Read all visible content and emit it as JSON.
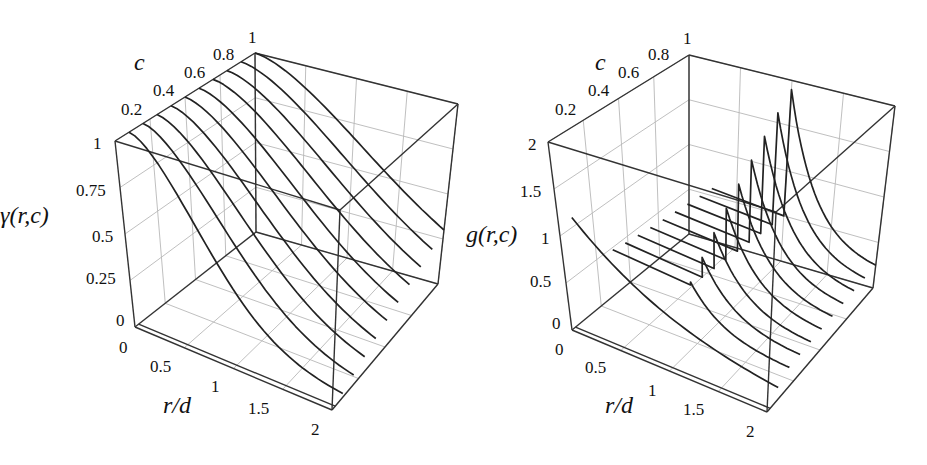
{
  "chart_data": [
    {
      "type": "line",
      "title": "",
      "zlabel": "γ(r,c)",
      "xlabel": "r/d",
      "ylabel": "c",
      "x_ticks": [
        "0",
        "0.5",
        "1",
        "1.5",
        "2"
      ],
      "y_ticks": [
        "0.2",
        "0.4",
        "0.6",
        "0.8",
        "1"
      ],
      "z_ticks": [
        "0",
        "0.25",
        "0.5",
        "0.75",
        "1"
      ],
      "xlim": [
        0,
        2
      ],
      "ylim": [
        0,
        1
      ],
      "zlim": [
        0,
        1
      ],
      "grid": true,
      "series_c": [
        0.1,
        0.2,
        0.3,
        0.4,
        0.5,
        0.6,
        0.7,
        0.8,
        0.9,
        1.0
      ],
      "description": "Curves of γ(r,c) vs r/d for c = 0.1..1.0; each starts at 1 at r=0 and decays smoothly, slower for larger c",
      "approx_end_values_r2": [
        0.02,
        0.05,
        0.08,
        0.11,
        0.14,
        0.17,
        0.2,
        0.23,
        0.26,
        0.3
      ]
    },
    {
      "type": "line",
      "title": "",
      "zlabel": "g(r,c)",
      "xlabel": "r/d",
      "ylabel": "c",
      "x_ticks": [
        "0",
        "0.5",
        "1",
        "1.5",
        "2"
      ],
      "y_ticks": [
        "0.2",
        "0.4",
        "0.6",
        "0.8",
        "1"
      ],
      "z_ticks": [
        "0",
        "0.5",
        "1",
        "1.5",
        "2"
      ],
      "xlim": [
        0,
        2
      ],
      "ylim": [
        0,
        1
      ],
      "zlim": [
        0,
        2
      ],
      "grid": true,
      "series_c": [
        0.1,
        0.2,
        0.3,
        0.4,
        0.5,
        0.6,
        0.7,
        0.8,
        0.9,
        1.0
      ],
      "description": "g(r,c) vs r/d: low plateau for r<1, jump at r/d=1 to a contact peak that rises with c, then decays toward ~0.2 at r=2",
      "approx_peak_values_r1": [
        0.55,
        0.7,
        0.85,
        1.0,
        1.15,
        1.3,
        1.45,
        1.6,
        1.75,
        1.9
      ],
      "approx_plateau_values_r_lt_1": [
        1.1,
        0.75,
        0.72,
        0.7,
        0.68,
        0.66,
        0.64,
        0.62,
        0.6,
        0.58
      ]
    }
  ],
  "plots": [
    {
      "zlabel": "γ(r,c)",
      "xlabel": "r/d",
      "ylabel": "c",
      "x_ticks": [
        "0",
        "0.5",
        "1",
        "1.5",
        "2"
      ],
      "y_ticks": [
        "0.2",
        "0.4",
        "0.6",
        "0.8",
        "1"
      ],
      "z_ticks": [
        "0",
        "0.25",
        "0.5",
        "0.75",
        "1"
      ]
    },
    {
      "zlabel": "g(r,c)",
      "xlabel": "r/d",
      "ylabel": "c",
      "x_ticks": [
        "0",
        "0.5",
        "1",
        "1.5",
        "2"
      ],
      "y_ticks": [
        "0.2",
        "0.4",
        "0.6",
        "0.8",
        "1"
      ],
      "z_ticks": [
        "0",
        "0.5",
        "1",
        "1.5",
        "2"
      ]
    }
  ]
}
